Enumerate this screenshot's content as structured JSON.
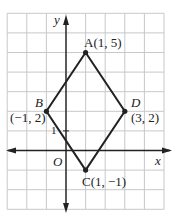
{
  "figure": {
    "type": "coordinate-grid-rhombus",
    "grid": {
      "x_min": -3,
      "x_max": 5,
      "y_min": -3,
      "y_max": 7,
      "color": "#c8c8c8"
    },
    "axes": {
      "x_label": "x",
      "y_label": "y",
      "origin_label": "O",
      "unit_tick_label": "1",
      "color": "#222222"
    },
    "shape": {
      "name": "rhombus ABCD",
      "stroke_color": "#222222",
      "vertices": [
        {
          "name": "A",
          "x": 1,
          "y": 5,
          "label": "A(1, 5)"
        },
        {
          "name": "D",
          "x": 3,
          "y": 2,
          "label_name": "D",
          "label_coords": "(3, 2)"
        },
        {
          "name": "C",
          "x": 1,
          "y": -1,
          "label": "C(1, −1)"
        },
        {
          "name": "B",
          "x": -1,
          "y": 2,
          "label_name": "B",
          "label_coords": "(−1, 2)"
        }
      ]
    }
  }
}
